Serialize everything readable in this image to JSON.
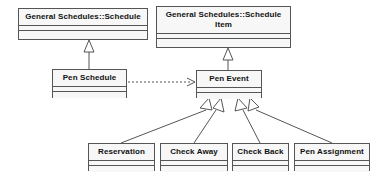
{
  "diagram": {
    "kind": "uml-class-diagram",
    "background_color": "#ffffff",
    "box_fill_color": "#f7f7f7",
    "line_color": "#555555",
    "classes": [
      {
        "id": "general-schedules-schedule",
        "name": "General Schedules::Schedule",
        "x": 18,
        "y": 8,
        "w": 130,
        "h": 32
      },
      {
        "id": "general-schedules-schedule-item",
        "name": "General Schedules::Schedule Item",
        "x": 156,
        "y": 6,
        "w": 135,
        "h": 42
      },
      {
        "id": "pen-schedule",
        "name": "Pen Schedule",
        "x": 52,
        "y": 69,
        "w": 75,
        "h": 29
      },
      {
        "id": "pen-event",
        "name": "Pen Event",
        "x": 196,
        "y": 70,
        "w": 66,
        "h": 28
      },
      {
        "id": "reservation",
        "name": "Reservation",
        "x": 88,
        "y": 143,
        "w": 67,
        "h": 28
      },
      {
        "id": "check-away",
        "name": "Check Away",
        "x": 160,
        "y": 143,
        "w": 68,
        "h": 28
      },
      {
        "id": "check-back",
        "name": "Check Back",
        "x": 232,
        "y": 143,
        "w": 57,
        "h": 28
      },
      {
        "id": "pen-assignment",
        "name": "Pen Assignment",
        "x": 294,
        "y": 143,
        "w": 76,
        "h": 28
      }
    ],
    "relationships": [
      {
        "id": "gen-pen-schedule",
        "type": "generalization",
        "from": "pen-schedule",
        "to": "general-schedules-schedule"
      },
      {
        "id": "gen-pen-event",
        "type": "generalization",
        "from": "pen-event",
        "to": "general-schedules-schedule-item"
      },
      {
        "id": "dep-pen-schedule-pen-event",
        "type": "dependency",
        "from": "pen-schedule",
        "to": "pen-event"
      },
      {
        "id": "gen-reservation",
        "type": "generalization",
        "from": "reservation",
        "to": "pen-event"
      },
      {
        "id": "gen-check-away",
        "type": "generalization",
        "from": "check-away",
        "to": "pen-event"
      },
      {
        "id": "gen-check-back",
        "type": "generalization",
        "from": "check-back",
        "to": "pen-event"
      },
      {
        "id": "gen-pen-assignment",
        "type": "generalization",
        "from": "pen-assignment",
        "to": "pen-event"
      }
    ]
  }
}
